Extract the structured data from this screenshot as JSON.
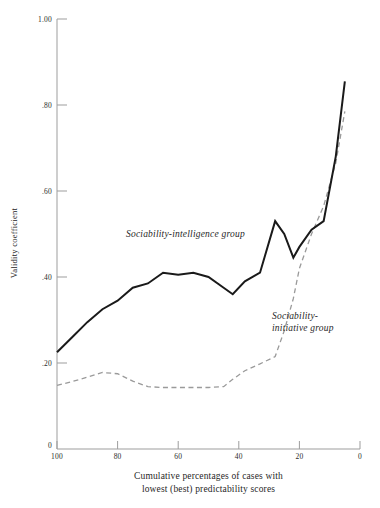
{
  "chart_data": {
    "type": "line",
    "title": "",
    "xlabel": "Cumulative percentages of cases with lowest (best) predictability scores",
    "xlabel_line1": "Cumulative percentages of cases with",
    "xlabel_line2": "lowest  (best) predictability scores",
    "ylabel": "Validity coefficient",
    "xlim": [
      100,
      0
    ],
    "ylim": [
      0,
      1.0
    ],
    "x_ticks": [
      100,
      80,
      60,
      40,
      20,
      0
    ],
    "x_tick_labels": [
      "100",
      "80",
      "60",
      "40",
      "20",
      "0"
    ],
    "y_ticks": [
      0,
      0.2,
      0.4,
      0.6,
      0.8,
      1.0
    ],
    "y_tick_labels": [
      "0",
      ".20",
      ".40",
      ".60",
      ".80",
      "1.00"
    ],
    "grid": false,
    "legend_position": "inline-annotations",
    "x_axis_direction": "descending",
    "series": [
      {
        "name": "Sociability-intelligence group",
        "annotation": "Sociability-intelligence group",
        "style": "solid",
        "color": "#1a1a1a",
        "width": 2.0,
        "x": [
          100,
          95,
          90,
          85,
          80,
          75,
          70,
          65,
          60,
          55,
          50,
          45,
          42,
          38,
          33,
          28,
          25,
          22,
          20,
          16,
          12,
          8,
          5
        ],
        "y": [
          0.225,
          0.26,
          0.295,
          0.325,
          0.345,
          0.375,
          0.385,
          0.41,
          0.405,
          0.41,
          0.4,
          0.375,
          0.36,
          0.39,
          0.41,
          0.53,
          0.5,
          0.445,
          0.47,
          0.51,
          0.53,
          0.68,
          0.855
        ]
      },
      {
        "name": "Sociability-initiative group",
        "annotation_line1": "Sociability-",
        "annotation_line2": "initiative group",
        "style": "dashed",
        "color": "#9a9a9a",
        "width": 1.3,
        "x": [
          100,
          95,
          90,
          85,
          80,
          75,
          70,
          65,
          60,
          55,
          50,
          45,
          42,
          38,
          33,
          28,
          25,
          22,
          20,
          16,
          12,
          8,
          5
        ],
        "y": [
          0.148,
          0.157,
          0.167,
          0.178,
          0.175,
          0.158,
          0.145,
          0.143,
          0.143,
          0.143,
          0.143,
          0.145,
          0.162,
          0.182,
          0.198,
          0.215,
          0.275,
          0.35,
          0.42,
          0.5,
          0.565,
          0.665,
          0.785
        ]
      }
    ]
  },
  "axes": {
    "y_title": "Validity coefficient",
    "x_title_line1": "Cumulative percentages of cases with",
    "x_title_line2": "lowest  (best) predictability scores",
    "y_tick_labels": [
      "1.00",
      ".80",
      ".60",
      ".40",
      ".20",
      "0"
    ],
    "x_tick_labels": [
      "100",
      "80",
      "60",
      "40",
      "20",
      "0"
    ]
  },
  "annotations": {
    "intelligence": "Sociability-intelligence group",
    "initiative_line1": "Sociability-",
    "initiative_line2": "initiative group"
  },
  "colors": {
    "solid_series": "#1a1a1a",
    "dashed_series": "#9a9a9a",
    "axis": "#8a8a8a",
    "text": "#1f1f1f",
    "background": "#ffffff"
  }
}
